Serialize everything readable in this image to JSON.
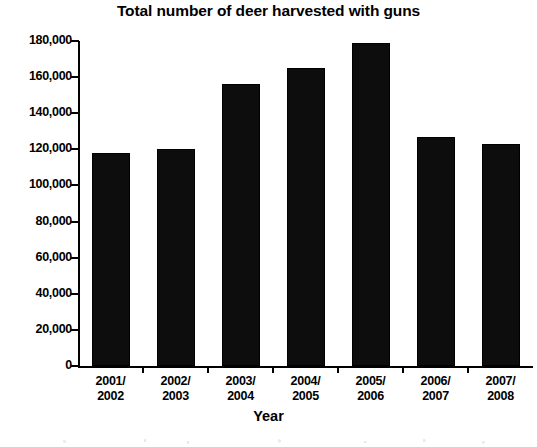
{
  "chart_data": {
    "type": "bar",
    "title": "Total number of deer harvested with guns",
    "xlabel": "Year",
    "ylabel": "",
    "categories": [
      "2001/ 2002",
      "2002/ 2003",
      "2003/ 2004",
      "2004/ 2005",
      "2005/ 2006",
      "2006/ 2007",
      "2007/ 2008"
    ],
    "category_lines": [
      [
        "2001/",
        "2002"
      ],
      [
        "2002/",
        "2003"
      ],
      [
        "2003/",
        "2004"
      ],
      [
        "2004/",
        "2005"
      ],
      [
        "2005/",
        "2006"
      ],
      [
        "2006/",
        "2007"
      ],
      [
        "2007/",
        "2008"
      ]
    ],
    "values": [
      118000,
      120000,
      156000,
      165000,
      179000,
      127000,
      123000
    ],
    "ylim": [
      0,
      180000
    ],
    "ytick_values": [
      180000,
      160000,
      140000,
      120000,
      100000,
      80000,
      60000,
      40000,
      20000,
      0
    ],
    "ytick_labels": [
      "180,000",
      "160,000",
      "140,000",
      "120,000",
      "100,000",
      "80,000",
      "60,000",
      "40,000",
      "20,000",
      "0"
    ],
    "grid": false,
    "legend": false,
    "bar_color": "#0d0d0d"
  }
}
